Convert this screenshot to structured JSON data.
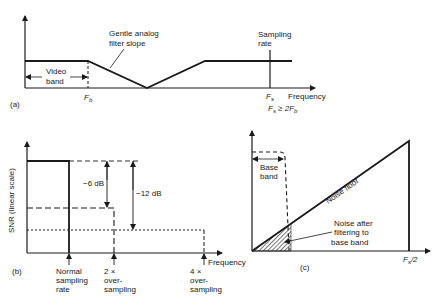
{
  "panel_a": {
    "label": "(a)",
    "filter_label_line1": "Gentle analog",
    "filter_label_line2": "filter slope",
    "video_band_line1": "Video",
    "video_band_line2": "band",
    "fb_label": "F",
    "fb_sub": "b",
    "sampling_line1": "Sampling",
    "sampling_line2": "rate",
    "fs_label": "F",
    "fs_sub": "s",
    "x_axis_label": "Frequency",
    "condition_fs": "F",
    "condition_s": "s",
    "condition_op": " ≥ 2F",
    "condition_b": "b"
  },
  "panel_b": {
    "label": "(b)",
    "y_axis_label": "SNR (linear scale)",
    "x_axis_label": "Frequency",
    "minus6": "−6 dB",
    "minus12": "−12 dB",
    "ticks": [
      {
        "l1": "Normal",
        "l2": "sampling",
        "l3": "rate"
      },
      {
        "l1": "2 ×",
        "l2": "over-",
        "l3": "sampling"
      },
      {
        "l1": "4 ×",
        "l2": "over-",
        "l3": "sampling"
      }
    ]
  },
  "panel_c": {
    "label": "(c)",
    "base_band_line1": "Base",
    "base_band_line2": "band",
    "noise_floor": "Noise floor",
    "noise_after_l1": "Noise after",
    "noise_after_l2": "filtering to",
    "noise_after_l3": "base band",
    "fs_half": "F",
    "fs_half_sub": "s",
    "fs_half_rest": "/2"
  }
}
